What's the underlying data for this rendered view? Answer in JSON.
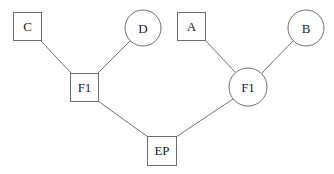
{
  "diagram": {
    "type": "tree",
    "nodes": [
      {
        "id": "C",
        "label": "C",
        "shape": "square"
      },
      {
        "id": "D",
        "label": "D",
        "shape": "circle"
      },
      {
        "id": "F1_left",
        "label": "F1",
        "shape": "square"
      },
      {
        "id": "A",
        "label": "A",
        "shape": "square"
      },
      {
        "id": "B",
        "label": "B",
        "shape": "circle"
      },
      {
        "id": "F1_right",
        "label": "F1",
        "shape": "circle"
      },
      {
        "id": "EP",
        "label": "EP",
        "shape": "square"
      }
    ],
    "edges": [
      {
        "from": "C",
        "to": "F1_left"
      },
      {
        "from": "D",
        "to": "F1_left"
      },
      {
        "from": "A",
        "to": "F1_right"
      },
      {
        "from": "B",
        "to": "F1_right"
      },
      {
        "from": "F1_left",
        "to": "EP"
      },
      {
        "from": "F1_right",
        "to": "EP"
      }
    ],
    "colors": {
      "stroke": "#6e6e6e",
      "text": "#222222",
      "background": "#ffffff"
    }
  }
}
